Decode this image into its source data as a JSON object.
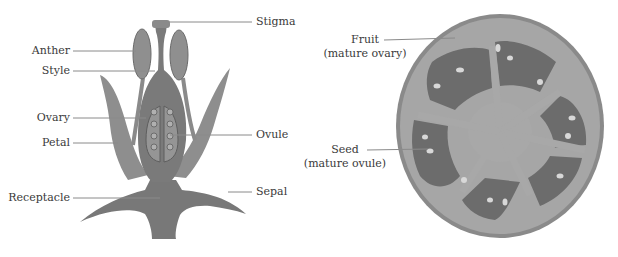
{
  "flower": {
    "title": "Flower cross-section",
    "labels": {
      "anther": "Anther",
      "style": "Style",
      "ovary": "Ovary",
      "petal": "Petal",
      "receptacle": "Receptacle",
      "stigma": "Stigma",
      "ovule": "Ovule",
      "sepal": "Sepal"
    }
  },
  "fruit": {
    "title": "Tomato cross-section",
    "labels": {
      "fruit": "Fruit",
      "fruit_sub": "(mature ovary)",
      "seed": "Seed",
      "seed_sub": "(mature ovule)"
    }
  },
  "colors": {
    "tissue_dark": "#6e6e6e",
    "tissue_mid": "#8c8c8c",
    "tissue_light": "#a8a8a8",
    "leader_line": "#8a8a8a",
    "text": "#3a3a3a"
  }
}
